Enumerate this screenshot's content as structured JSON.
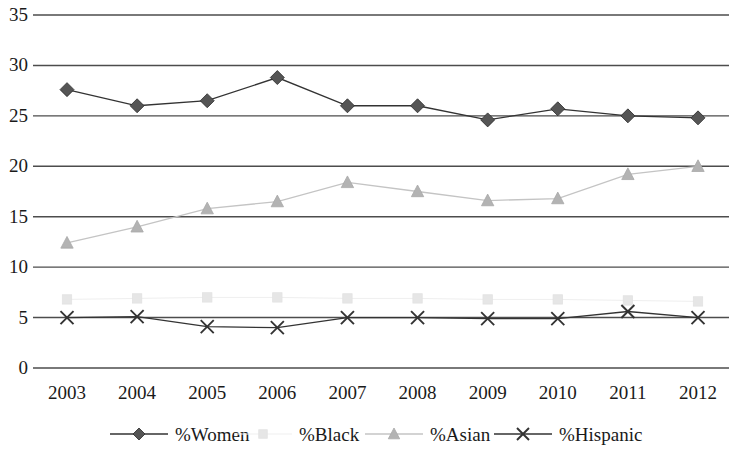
{
  "chart_data": {
    "type": "line",
    "title": "",
    "xlabel": "",
    "ylabel": "",
    "categories": [
      "2003",
      "2004",
      "2005",
      "2006",
      "2007",
      "2008",
      "2009",
      "2010",
      "2011",
      "2012"
    ],
    "ylim": [
      0,
      35
    ],
    "ytick_values": [
      0,
      5,
      10,
      15,
      20,
      25,
      30,
      35
    ],
    "ytick_labels": [
      "0",
      "5",
      "10",
      "15",
      "20",
      "25",
      "30",
      "35"
    ],
    "grid": "horizontal",
    "legend_position": "bottom",
    "series": [
      {
        "name": "%Women",
        "marker": "diamond",
        "color": "#555555",
        "line_color": "#333333",
        "values": [
          27.6,
          26.0,
          26.5,
          28.8,
          26.0,
          26.0,
          24.6,
          25.7,
          25.0,
          24.8
        ]
      },
      {
        "name": "%Black",
        "marker": "square",
        "color": "#e6e6e6",
        "line_color": "#efefef",
        "values": [
          6.8,
          6.9,
          7.0,
          7.0,
          6.9,
          6.9,
          6.8,
          6.8,
          6.7,
          6.6
        ]
      },
      {
        "name": "%Asian",
        "marker": "triangle",
        "color": "#b3b3b3",
        "line_color": "#c4c4c4",
        "values": [
          12.4,
          14.0,
          15.8,
          16.5,
          18.4,
          17.5,
          16.6,
          16.8,
          19.2,
          20.0
        ]
      },
      {
        "name": "%Hispanic",
        "marker": "cross",
        "color": "#333333",
        "line_color": "#333333",
        "values": [
          5.0,
          5.1,
          4.1,
          4.0,
          5.0,
          5.0,
          4.9,
          4.9,
          5.6,
          5.0
        ]
      }
    ]
  },
  "axes": {
    "gridline_color": "#4d4d4d",
    "background": "#ffffff"
  }
}
